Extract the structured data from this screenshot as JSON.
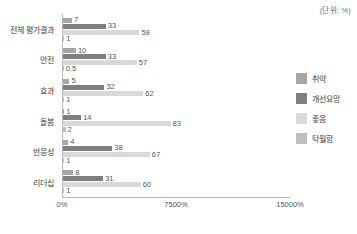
{
  "unit_note": "(단위: %)",
  "chart_data": {
    "type": "bar",
    "orientation": "horizontal",
    "title": "",
    "subtitle": "",
    "xlabel": "",
    "ylabel": "",
    "grid": false,
    "legend_position": "right",
    "categories": [
      "전체 평가결과",
      "안전",
      "효과",
      "돌봄",
      "반응성",
      "리더십"
    ],
    "series": [
      {
        "name": "취약",
        "color": "#a6a6a6",
        "values": [
          7,
          10,
          5,
          1,
          4,
          8
        ]
      },
      {
        "name": "개선요망",
        "color": "#7f7f7f",
        "values": [
          33,
          33,
          32,
          14,
          38,
          31
        ]
      },
      {
        "name": "좋음",
        "color": "#d9d9d9",
        "values": [
          59,
          57,
          62,
          83,
          67,
          60
        ]
      },
      {
        "name": "탁월함",
        "color": "#bfbfbf",
        "values": [
          1,
          0.5,
          1,
          2,
          1,
          1
        ]
      }
    ],
    "bar_labels": [
      [
        "7",
        "33",
        "59",
        "1"
      ],
      [
        "10",
        "33",
        "57",
        "0.5"
      ],
      [
        "5",
        "32",
        "62",
        "1"
      ],
      [
        "1",
        "14",
        "83",
        "2"
      ],
      [
        "4",
        "38",
        "67",
        "1"
      ],
      [
        "8",
        "31",
        "60",
        "1"
      ]
    ],
    "xticks": [
      {
        "label": "0%",
        "value": 0
      },
      {
        "label": "7500%",
        "value": 7500
      },
      {
        "label": "15000%",
        "value": 15000
      }
    ],
    "xlim": [
      0,
      15000
    ],
    "bar_value_scale_max": 176
  },
  "legend": {
    "items": [
      {
        "label": "취약",
        "color": "#a6a6a6"
      },
      {
        "label": "개선요망",
        "color": "#7f7f7f"
      },
      {
        "label": "좋음",
        "color": "#d9d9d9"
      },
      {
        "label": "탁월함",
        "color": "#bfbfbf"
      }
    ]
  },
  "axis_color": "#b9b9b9"
}
